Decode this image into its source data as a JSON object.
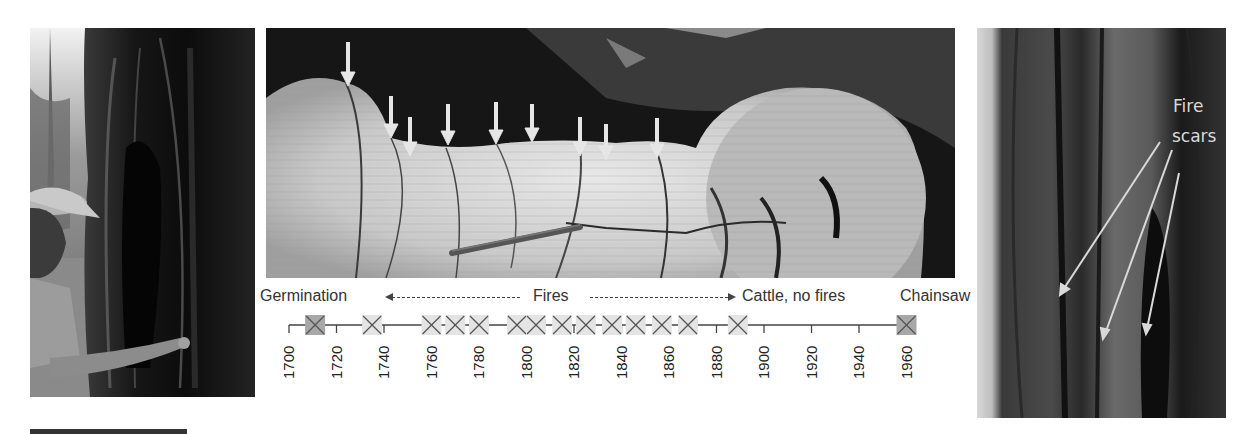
{
  "figure": {
    "panels": {
      "left": {
        "description": "Person pointing at fire-scarred tree trunk"
      },
      "center": {
        "description": "Cross-section of tree stump showing fire scars marked with arrows",
        "arrow_count": 9
      },
      "right": {
        "description": "Tree trunk with fire scars",
        "annotation_line1": "Fire",
        "annotation_line2": "scars"
      }
    },
    "timeline": {
      "labels": {
        "germination": "Germination",
        "fires": "Fires",
        "cattle": "Cattle, no fires",
        "chainsaw": "Chainsaw"
      },
      "year_ticks": [
        "1700",
        "1720",
        "1740",
        "1760",
        "1780",
        "1800",
        "1820",
        "1840",
        "1860",
        "1880",
        "1900",
        "1920",
        "1940",
        "1960"
      ],
      "axis_start": 1700,
      "axis_end": 1960,
      "germination_year": 1711,
      "fire_years": [
        1735,
        1760,
        1770,
        1780,
        1796,
        1804,
        1815,
        1825,
        1836,
        1846,
        1857,
        1868,
        1889
      ],
      "chainsaw_year": 1960
    },
    "colors": {
      "marker_fill_light": "#e4e4e4",
      "marker_fill_dark": "#a8a8a8",
      "line": "#444444",
      "text": "#333333"
    }
  },
  "chart_data": {
    "type": "timeline",
    "title": "",
    "xlabel": "Year",
    "xlim": [
      1700,
      1960
    ],
    "tick_labels": [
      "1700",
      "1720",
      "1740",
      "1760",
      "1780",
      "1800",
      "1820",
      "1840",
      "1860",
      "1880",
      "1900",
      "1920",
      "1940",
      "1960"
    ],
    "events": [
      {
        "year": 1711,
        "type": "germination"
      },
      {
        "year": 1735,
        "type": "fire"
      },
      {
        "year": 1760,
        "type": "fire"
      },
      {
        "year": 1770,
        "type": "fire"
      },
      {
        "year": 1780,
        "type": "fire"
      },
      {
        "year": 1796,
        "type": "fire"
      },
      {
        "year": 1804,
        "type": "fire"
      },
      {
        "year": 1815,
        "type": "fire"
      },
      {
        "year": 1825,
        "type": "fire"
      },
      {
        "year": 1836,
        "type": "fire"
      },
      {
        "year": 1846,
        "type": "fire"
      },
      {
        "year": 1857,
        "type": "fire"
      },
      {
        "year": 1868,
        "type": "fire"
      },
      {
        "year": 1889,
        "type": "fire"
      },
      {
        "year": 1960,
        "type": "chainsaw"
      }
    ],
    "periods": [
      {
        "label": "Germination",
        "start": 1700,
        "end": 1711
      },
      {
        "label": "Fires",
        "start": 1711,
        "end": 1889
      },
      {
        "label": "Cattle, no fires",
        "start": 1889,
        "end": 1960
      },
      {
        "label": "Chainsaw",
        "start": 1960,
        "end": 1960
      }
    ]
  }
}
